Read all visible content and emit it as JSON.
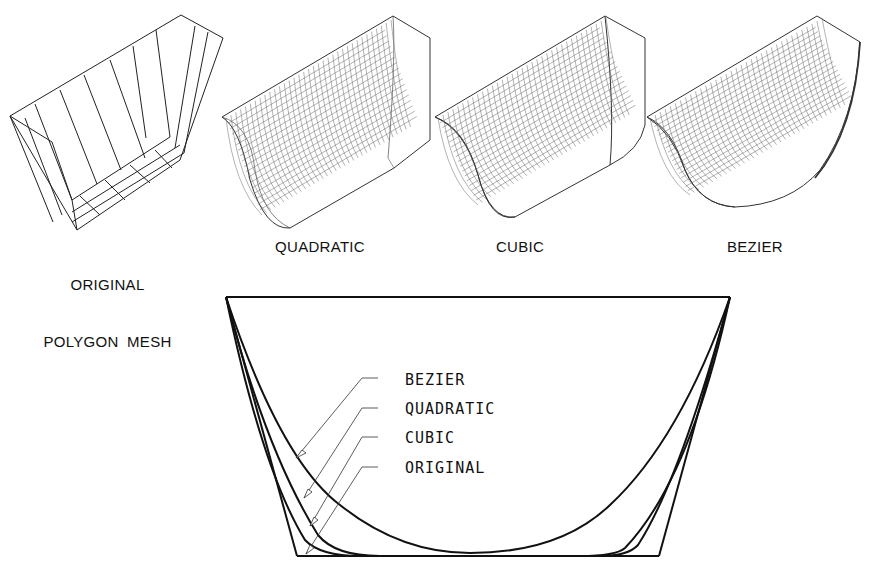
{
  "figure": {
    "panels": [
      {
        "id": "original",
        "caption_line1": "ORIGINAL",
        "caption_line2": "POLYGON MESH"
      },
      {
        "id": "quadratic",
        "caption": "QUADRATIC"
      },
      {
        "id": "cubic",
        "caption": "CUBIC"
      },
      {
        "id": "bezier",
        "caption": "BEZIER"
      }
    ],
    "section": {
      "leaders": [
        {
          "label": "BEZIER"
        },
        {
          "label": "QUADRATIC"
        },
        {
          "label": "CUBIC"
        },
        {
          "label": "ORIGINAL"
        }
      ]
    },
    "colors": {
      "line": "#111111",
      "mesh": "#444444",
      "background": "#ffffff"
    }
  }
}
